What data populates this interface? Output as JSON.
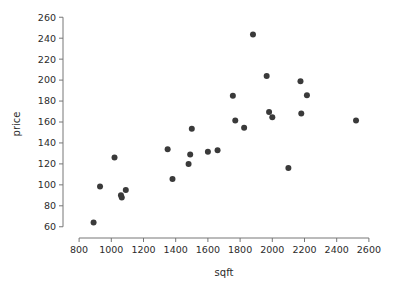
{
  "chart_data": {
    "type": "scatter",
    "title": "",
    "xlabel": "sqft",
    "ylabel": "price",
    "xlim": [
      700,
      2700
    ],
    "ylim": [
      55,
      265
    ],
    "grid": false,
    "legend": null,
    "xticks": [
      800,
      1000,
      1200,
      1400,
      1600,
      1800,
      2000,
      2200,
      2400,
      2600
    ],
    "yticks": [
      60,
      80,
      100,
      120,
      140,
      160,
      180,
      200,
      220,
      240,
      260
    ],
    "xtick_labels": [
      "800",
      "1000",
      "1200",
      "1400",
      "1600",
      "1800",
      "2000",
      "2200",
      "2400",
      "2600"
    ],
    "ytick_labels": [
      "60",
      "80",
      "100",
      "120",
      "140",
      "160",
      "180",
      "200",
      "220",
      "240",
      "260"
    ],
    "marker": "circle",
    "marker_color": "#3a3a3a",
    "marker_size": 3,
    "x": [
      890,
      930,
      1020,
      1060,
      1065,
      1090,
      1350,
      1380,
      1480,
      1490,
      1500,
      1600,
      1660,
      1755,
      1770,
      1825,
      1880,
      1965,
      1980,
      2000,
      2100,
      2175,
      2180,
      2215,
      2520
    ],
    "y": [
      64,
      98.5,
      126,
      90,
      88,
      95,
      134,
      105.5,
      120,
      129,
      153.5,
      131.5,
      133,
      185,
      161.5,
      154.5,
      243.5,
      204,
      169.5,
      164.5,
      116,
      199,
      168,
      185.5,
      161.5
    ],
    "points": [
      {
        "sqft": 890,
        "price": 64
      },
      {
        "sqft": 930,
        "price": 98.5
      },
      {
        "sqft": 1020,
        "price": 126
      },
      {
        "sqft": 1060,
        "price": 90
      },
      {
        "sqft": 1065,
        "price": 88
      },
      {
        "sqft": 1090,
        "price": 95
      },
      {
        "sqft": 1350,
        "price": 134
      },
      {
        "sqft": 1380,
        "price": 105.5
      },
      {
        "sqft": 1480,
        "price": 120
      },
      {
        "sqft": 1490,
        "price": 129
      },
      {
        "sqft": 1500,
        "price": 153.5
      },
      {
        "sqft": 1600,
        "price": 131.5
      },
      {
        "sqft": 1660,
        "price": 133
      },
      {
        "sqft": 1755,
        "price": 185
      },
      {
        "sqft": 1770,
        "price": 161.5
      },
      {
        "sqft": 1825,
        "price": 154.5
      },
      {
        "sqft": 1880,
        "price": 243.5
      },
      {
        "sqft": 1965,
        "price": 204
      },
      {
        "sqft": 1980,
        "price": 169.5
      },
      {
        "sqft": 2000,
        "price": 164.5
      },
      {
        "sqft": 2100,
        "price": 116
      },
      {
        "sqft": 2175,
        "price": 199
      },
      {
        "sqft": 2180,
        "price": 168
      },
      {
        "sqft": 2215,
        "price": 185.5
      },
      {
        "sqft": 2520,
        "price": 161.5
      }
    ]
  }
}
